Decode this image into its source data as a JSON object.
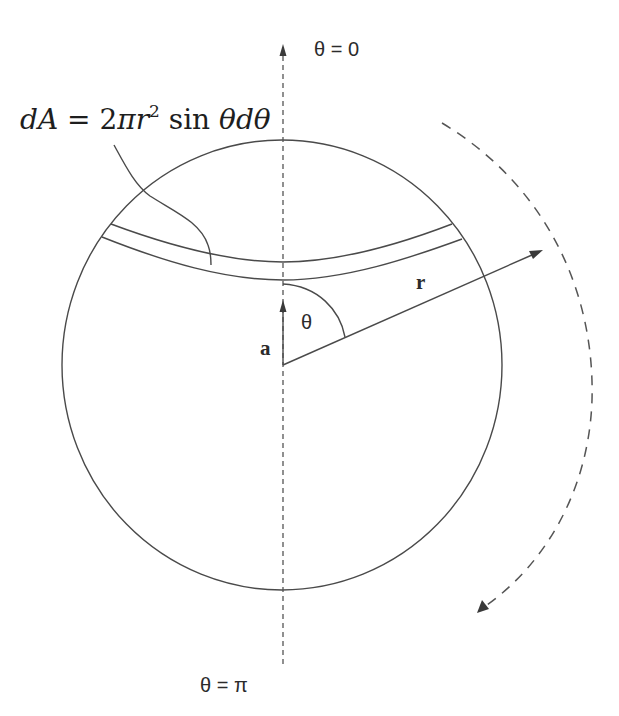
{
  "diagram": {
    "labels": {
      "theta_zero": "θ = 0",
      "theta_pi": "θ = π",
      "theta": "θ",
      "vector_a": "a",
      "vector_r": "r"
    },
    "equation": {
      "lhs_d": "d",
      "lhs_A": "A",
      "equals": " = 2",
      "pi": "π",
      "r": "r",
      "exponent": "2",
      "sin": " sin ",
      "theta1": "θ",
      "d": "d",
      "theta2": "θ",
      "full_text": "dA = 2πr² sin θ dθ"
    },
    "colors": {
      "line": "#4a4a4a",
      "text": "#2b2b2b",
      "background": "#ffffff"
    },
    "geometry": {
      "sphere_center": [
        282,
        365
      ],
      "sphere_radius_x": 220,
      "sphere_radius_y": 225,
      "polar_axis_x": 283,
      "vector_a_tip": [
        283,
        302
      ],
      "vector_r_tip": [
        542,
        251
      ],
      "rotation_arc": "dashed arc around right side indicating sweep from θ = 0 to θ = π"
    }
  }
}
